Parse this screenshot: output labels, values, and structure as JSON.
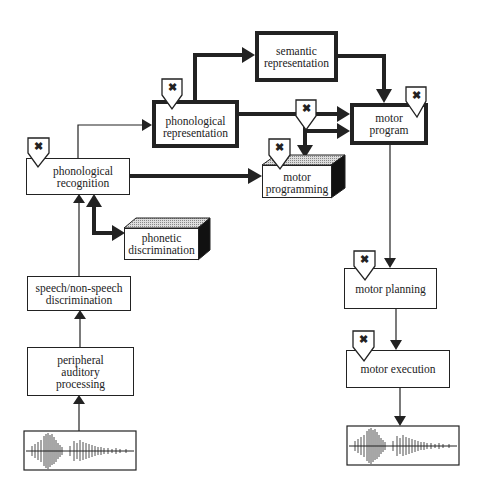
{
  "diagram": {
    "nodes": {
      "semantic_representation": "semantic\nrepresentation",
      "phonological_representation": "phonological\nrepresentation",
      "motor_program": "motor\nprogram",
      "phonological_recognition": "phonological\nrecognition",
      "motor_programming": "motor\nprogramming",
      "phonetic_discrimination": "phonetic\ndiscrimination",
      "speech_nonspeech_discrimination": "speech/non-speech\ndiscrimination",
      "peripheral_auditory_processing": "peripheral\nauditory\nprocessing",
      "motor_planning": "motor planning",
      "motor_execution": "motor execution"
    },
    "marker_symbol": "✖",
    "waveforms": [
      "input-speech-waveform",
      "output-speech-waveform"
    ]
  }
}
